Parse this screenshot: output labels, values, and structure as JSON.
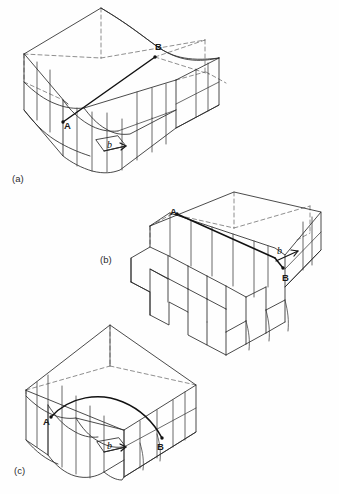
{
  "figure": {
    "background_color": "#fefefe",
    "ink_color": "#2b2b2b",
    "hidden_edge_color": "#6a6a6a",
    "dislocation_line_color": "#111111",
    "panels": [
      {
        "id": "a",
        "caption": "(a)",
        "caption_x": 12,
        "caption_y": 182,
        "type": "edge-dislocation",
        "labels": [
          {
            "text": "A",
            "x": 68,
            "y": 126,
            "kind": "point-label"
          },
          {
            "text": "B",
            "x": 158,
            "y": 52,
            "kind": "point-label"
          },
          {
            "text": "b",
            "x": 110,
            "y": 146,
            "kind": "burgers-vector"
          }
        ]
      },
      {
        "id": "b",
        "caption": "(b)",
        "caption_x": 100,
        "caption_y": 263,
        "type": "screw-dislocation",
        "labels": [
          {
            "text": "A",
            "x": 174,
            "y": 212,
            "kind": "point-label"
          },
          {
            "text": "B",
            "x": 286,
            "y": 276,
            "kind": "point-label"
          },
          {
            "text": "b",
            "x": 281,
            "y": 255,
            "kind": "burgers-vector"
          }
        ]
      },
      {
        "id": "c",
        "caption": "(c)",
        "caption_x": 14,
        "caption_y": 474,
        "type": "mixed-dislocation",
        "labels": [
          {
            "text": "A",
            "x": 47,
            "y": 422,
            "kind": "point-label"
          },
          {
            "text": "B",
            "x": 158,
            "y": 443,
            "kind": "point-label"
          },
          {
            "text": "b",
            "x": 110,
            "y": 446,
            "kind": "burgers-vector"
          }
        ]
      }
    ]
  }
}
